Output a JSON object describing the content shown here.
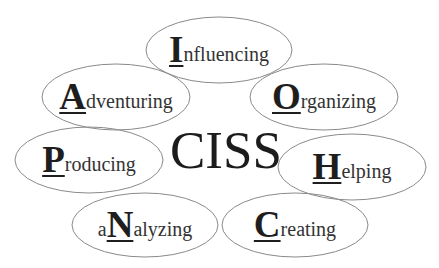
{
  "title": "CISS",
  "stroke_color": "#8a8a8a",
  "nodes": [
    {
      "id": "influencing",
      "pre": "",
      "cap": "I",
      "rest": "nfluencing",
      "cx": 219,
      "cy": 50,
      "rx": 73,
      "ry": 33
    },
    {
      "id": "adventuring",
      "pre": "",
      "cap": "A",
      "rest": "dventuring",
      "cx": 116,
      "cy": 97,
      "rx": 74,
      "ry": 33
    },
    {
      "id": "organizing",
      "pre": "",
      "cap": "O",
      "rest": "rganizing",
      "cx": 324,
      "cy": 97,
      "rx": 74,
      "ry": 33
    },
    {
      "id": "producing",
      "pre": "",
      "cap": "P",
      "rest": "roducing",
      "cx": 89,
      "cy": 160,
      "rx": 74,
      "ry": 33
    },
    {
      "id": "helping",
      "pre": "",
      "cap": "H",
      "rest": "elping",
      "cx": 352,
      "cy": 167,
      "rx": 74,
      "ry": 33
    },
    {
      "id": "analyzing",
      "pre": "a",
      "cap": "N",
      "rest": "alyzing",
      "cx": 145,
      "cy": 225,
      "rx": 73,
      "ry": 32
    },
    {
      "id": "creating",
      "pre": "",
      "cap": "C",
      "rest": "reating",
      "cx": 295,
      "cy": 225,
      "rx": 73,
      "ry": 32
    }
  ]
}
